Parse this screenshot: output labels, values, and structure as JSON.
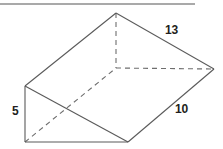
{
  "figure": {
    "name": "triangular-prism",
    "top_rule": {
      "name": "horizontal-rule",
      "color": "#8c8c8c",
      "x1": 0,
      "y1": 4,
      "x2": 195,
      "y2": 4,
      "stroke_width": 1.6
    },
    "style": {
      "solid_edge_color": "#5a5a5a",
      "hidden_edge_color": "#6e6e6e",
      "label_color": "#231f20",
      "background": "#ffffff",
      "solid_stroke_width": 1.1,
      "hidden_stroke_width": 1.1,
      "hidden_dash_pattern": "5,4"
    },
    "vertices": {
      "apex_back_top": {
        "name": "A",
        "x": 116,
        "y": 13
      },
      "left_top": {
        "name": "B",
        "x": 25,
        "y": 86
      },
      "left_bottom": {
        "name": "C",
        "x": 25,
        "y": 142
      },
      "front_bottom": {
        "name": "D",
        "x": 128,
        "y": 142
      },
      "right_corner": {
        "name": "E",
        "x": 214,
        "y": 69
      },
      "hidden_back_base": {
        "name": "F",
        "x": 116,
        "y": 68
      }
    },
    "solid_edges": [
      {
        "name": "edge-apex-to-left-top",
        "x1": 116,
        "y1": 13,
        "x2": 25,
        "y2": 86
      },
      {
        "name": "edge-apex-to-right",
        "x1": 116,
        "y1": 13,
        "x2": 214,
        "y2": 69
      },
      {
        "name": "edge-left-top-to-left-bottom",
        "x1": 25,
        "y1": 86,
        "x2": 25,
        "y2": 142
      },
      {
        "name": "edge-left-top-to-front-bottom",
        "x1": 25,
        "y1": 86,
        "x2": 128,
        "y2": 142
      },
      {
        "name": "edge-left-bottom-to-front-bottom",
        "x1": 25,
        "y1": 142,
        "x2": 128,
        "y2": 142
      },
      {
        "name": "edge-front-bottom-to-right",
        "x1": 128,
        "y1": 142,
        "x2": 214,
        "y2": 69
      }
    ],
    "hidden_edges": [
      {
        "name": "hidden-edge-apex-to-back-base",
        "x1": 116,
        "y1": 13,
        "x2": 116,
        "y2": 68
      },
      {
        "name": "hidden-edge-back-base-to-right",
        "x1": 116,
        "y1": 68,
        "x2": 214,
        "y2": 69
      },
      {
        "name": "hidden-edge-left-bottom-to-back-base",
        "x1": 25,
        "y1": 142,
        "x2": 116,
        "y2": 68
      }
    ],
    "labels": [
      {
        "name": "dimension-label-13",
        "text": "13",
        "x": 165,
        "y": 24,
        "edge": "edge-apex-to-right"
      },
      {
        "name": "dimension-label-10",
        "text": "10",
        "x": 175,
        "y": 103,
        "edge": "edge-front-bottom-to-right"
      },
      {
        "name": "dimension-label-5",
        "text": "5",
        "x": 12,
        "y": 105,
        "edge": "edge-left-top-to-left-bottom"
      }
    ]
  }
}
